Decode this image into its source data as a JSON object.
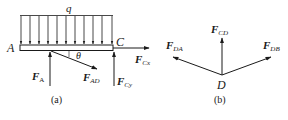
{
  "figure_a": {
    "caption": "(a)",
    "load_label": "q",
    "point_A": "A",
    "point_C": "C",
    "angle_label": "θ",
    "forces": {
      "FA": {
        "main": "F",
        "sub": "A"
      },
      "FAD": {
        "main": "F",
        "sub": "AD"
      },
      "FCx": {
        "main": "F",
        "sub": "Cx"
      },
      "FCy": {
        "main": "F",
        "sub": "Cy"
      }
    }
  },
  "figure_b": {
    "caption": "(b)",
    "point_D": "D",
    "forces": {
      "FCD": {
        "main": "F",
        "sub": "CD"
      },
      "FDA": {
        "main": "F",
        "sub": "DA"
      },
      "FDB": {
        "main": "F",
        "sub": "DB"
      }
    }
  },
  "colors": {
    "line": "#1a1a1a",
    "background": "#ffffff"
  }
}
